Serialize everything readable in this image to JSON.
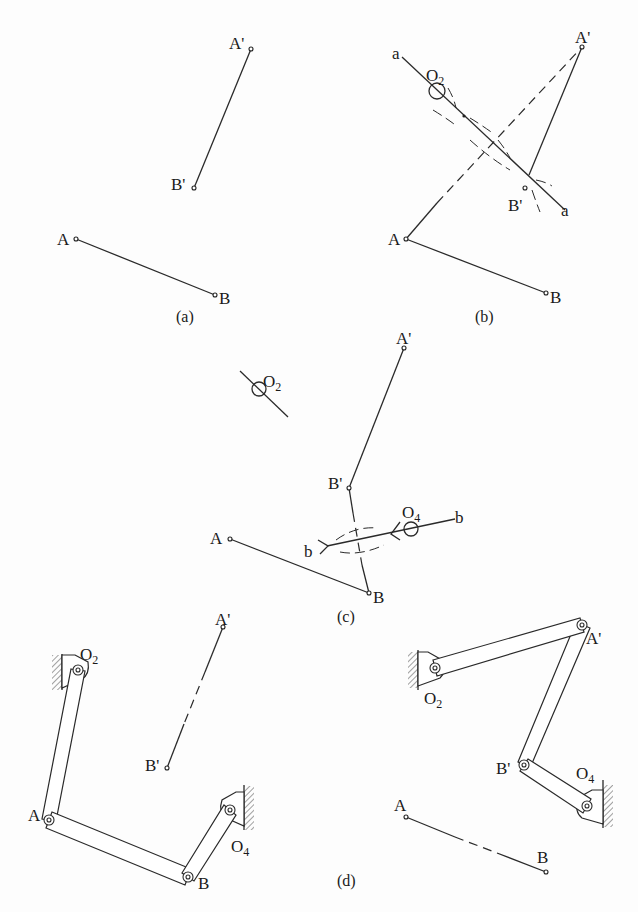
{
  "figure": {
    "background": "#fdfdfd",
    "stroke_color": "#2a2a2a",
    "panels": {
      "a": {
        "caption": "(a)",
        "points": {
          "A": [
            76,
            239
          ],
          "B": [
            215,
            295
          ],
          "A_prime": [
            251,
            49
          ],
          "B_prime": [
            194,
            188
          ]
        },
        "labels": {
          "A": "A",
          "B": "B",
          "A_prime": "A'",
          "B_prime": "B'"
        }
      },
      "b": {
        "caption": "(b)",
        "points": {
          "A": [
            406,
            239
          ],
          "B": [
            546,
            293
          ],
          "A_prime": [
            582,
            47
          ],
          "B_prime": [
            525,
            188
          ],
          "O2": [
            437,
            91
          ],
          "bisector_start": [
            402,
            57
          ],
          "bisector_end": [
            560,
            205
          ]
        },
        "labels": {
          "A": "A",
          "B": "B",
          "A_prime": "A'",
          "B_prime": "B'",
          "O": "O",
          "O_sub": "2",
          "a_start": "a",
          "a_end": "a"
        }
      },
      "c": {
        "caption": "(c)",
        "points": {
          "A": [
            230,
            539
          ],
          "B": [
            369,
            593
          ],
          "A_prime": [
            404,
            348
          ],
          "B_prime": [
            349,
            488
          ],
          "O2": [
            259,
            389
          ],
          "O4": [
            411,
            529
          ]
        },
        "labels": {
          "A": "A",
          "B": "B",
          "A_prime": "A'",
          "B_prime": "B'",
          "O": "O",
          "O2_sub": "2",
          "O4_sub": "4",
          "b_start": "b",
          "b_end": "b"
        }
      },
      "d": {
        "caption": "(d)",
        "left": {
          "points": {
            "O2": [
              78,
              670
            ],
            "A": [
              49,
              820
            ],
            "B": [
              188,
              877
            ],
            "O4": [
              230,
              810
            ],
            "A_prime": [
              223,
              627
            ],
            "B_prime": [
              167,
              768
            ]
          },
          "labels": {
            "O": "O",
            "O2_sub": "2",
            "O4_sub": "4",
            "A": "A",
            "B": "B",
            "A_prime": "A'",
            "B_prime": "B'"
          }
        },
        "right": {
          "points": {
            "O2": [
              435,
              668
            ],
            "A_prime": [
              582,
              625
            ],
            "B_prime": [
              524,
              765
            ],
            "O4": [
              587,
              806
            ],
            "A": [
              406,
              817
            ],
            "B": [
              546,
              872
            ]
          },
          "labels": {
            "O": "O",
            "O2_sub": "2",
            "O4_sub": "4",
            "A": "A",
            "B": "B",
            "A_prime": "A'",
            "B_prime": "B'"
          }
        }
      }
    }
  }
}
